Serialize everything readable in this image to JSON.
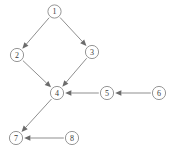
{
  "diagram": {
    "background_color": "#ffffff",
    "node_fill": "#ffffff",
    "node_stroke": "#8a8a8a",
    "label_color": "#3a3a3a",
    "edge_color": "#8f8f8f",
    "arrowhead_color": "#6b6b6b",
    "node_radius": 6.6,
    "nodes": [
      {
        "id": "1",
        "label": "1",
        "cx": 54.5,
        "cy": 11.5
      },
      {
        "id": "2",
        "label": "2",
        "cx": 17.0,
        "cy": 55.0
      },
      {
        "id": "3",
        "label": "3",
        "cx": 92.0,
        "cy": 52.0
      },
      {
        "id": "4",
        "label": "4",
        "cx": 57.0,
        "cy": 93.0
      },
      {
        "id": "5",
        "label": "5",
        "cx": 107.0,
        "cy": 93.0
      },
      {
        "id": "6",
        "label": "6",
        "cx": 159.0,
        "cy": 93.0
      },
      {
        "id": "7",
        "label": "7",
        "cx": 16.0,
        "cy": 138.0
      },
      {
        "id": "8",
        "label": "8",
        "cx": 72.0,
        "cy": 138.0
      }
    ],
    "edges": [
      {
        "id": "e1-2",
        "from": "1",
        "to": "2",
        "label": "1 to 2"
      },
      {
        "id": "e1-3",
        "from": "1",
        "to": "3",
        "label": "1 to 3"
      },
      {
        "id": "e2-4",
        "from": "2",
        "to": "4",
        "label": "2 to 4"
      },
      {
        "id": "e3-4",
        "from": "3",
        "to": "4",
        "label": "3 to 4"
      },
      {
        "id": "e5-4",
        "from": "5",
        "to": "4",
        "label": "5 to 4"
      },
      {
        "id": "e6-5",
        "from": "6",
        "to": "5",
        "label": "6 to 5"
      },
      {
        "id": "e4-7",
        "from": "4",
        "to": "7",
        "label": "4 to 7"
      },
      {
        "id": "e8-7",
        "from": "8",
        "to": "7",
        "label": "8 to 7"
      }
    ]
  }
}
